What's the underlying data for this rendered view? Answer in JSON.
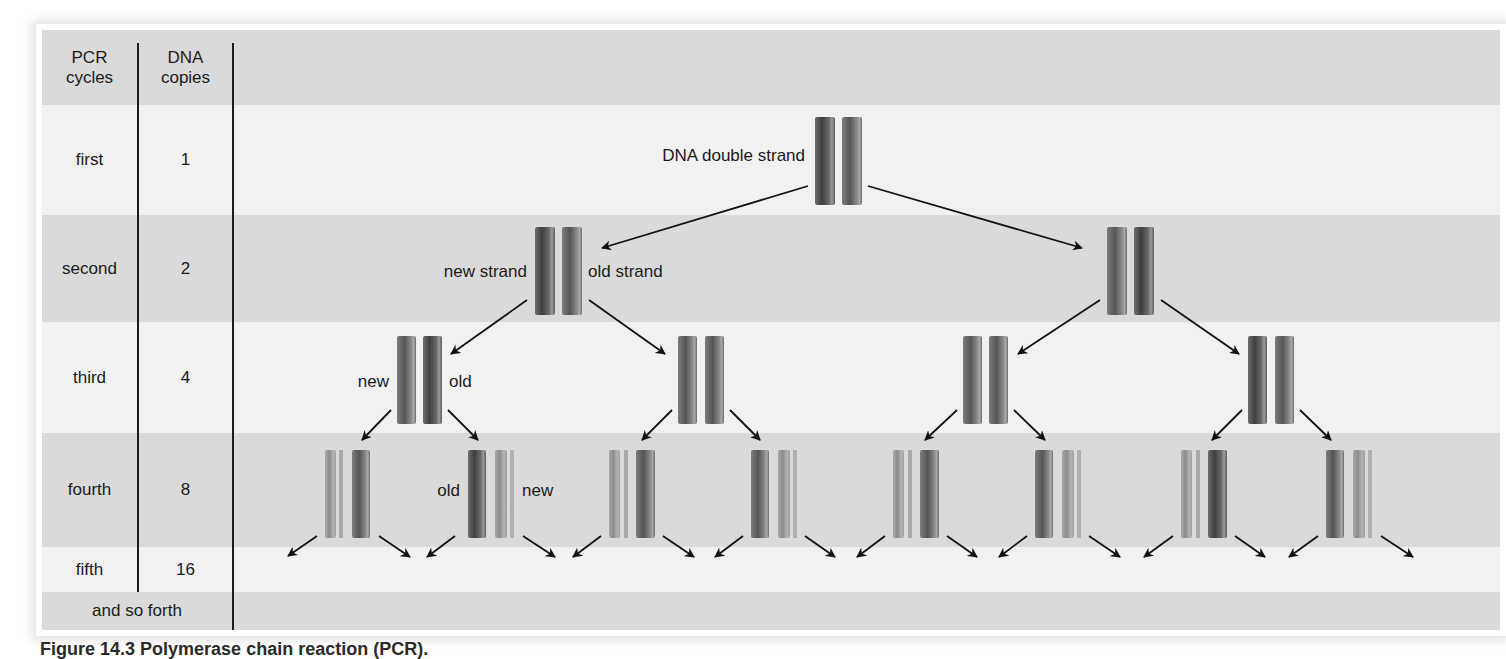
{
  "table": {
    "headers": [
      "PCR\ncycles",
      "DNA\ncopies"
    ],
    "header_col1": "PCR cycles",
    "header_col2": "DNA copies",
    "rows": [
      {
        "cycle": "first",
        "copies": "1"
      },
      {
        "cycle": "second",
        "copies": "2"
      },
      {
        "cycle": "third",
        "copies": "4"
      },
      {
        "cycle": "fourth",
        "copies": "8"
      },
      {
        "cycle": "fifth",
        "copies": "16"
      }
    ],
    "footer": "and so forth"
  },
  "diagram": {
    "labels": {
      "double_strand": "DNA double strand",
      "new_strand": "new strand",
      "old_strand": "old strand",
      "new": "new",
      "old": "old",
      "old_g4": "old",
      "new_g4": "new"
    },
    "generations": [
      {
        "cycle": "first",
        "copies": 1,
        "pair_x": [
          815
        ]
      },
      {
        "cycle": "second",
        "copies": 2,
        "pair_x": [
          535,
          1107
        ]
      },
      {
        "cycle": "third",
        "copies": 4,
        "pair_x": [
          397,
          678,
          963,
          1248
        ]
      },
      {
        "cycle": "fourth",
        "copies": 8,
        "pair_x": [
          325,
          468,
          609,
          751,
          893,
          1035,
          1181,
          1326
        ]
      }
    ],
    "colors": {
      "band_dark": "#dadada",
      "band_light": "#f1f1f1",
      "strand_dark": "#5a5a5a",
      "strand_light": "#9a9a9a",
      "arrow": "#111111"
    }
  },
  "caption": {
    "figure_number": "Figure 14.3",
    "title": "Polymerase chain reaction (PCR).",
    "truncated_text": ""
  }
}
